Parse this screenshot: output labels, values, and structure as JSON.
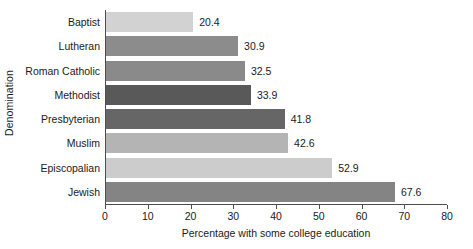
{
  "chart_data": {
    "type": "bar",
    "orientation": "horizontal",
    "title": "",
    "xlabel": "Percentage with some college education",
    "ylabel": "Denomination",
    "categories": [
      "Baptist",
      "Lutheran",
      "Roman Catholic",
      "Methodist",
      "Presbyterian",
      "Muslim",
      "Episcopalian",
      "Jewish"
    ],
    "values": [
      20.4,
      30.9,
      32.5,
      33.9,
      41.8,
      42.6,
      52.9,
      67.6
    ],
    "value_labels": [
      "20.4",
      "30.9",
      "32.5",
      "33.9",
      "41.8",
      "42.6",
      "52.9",
      "67.6"
    ],
    "bar_colors": [
      "#d2d2d2",
      "#8c8c8c",
      "#8a8a8a",
      "#595959",
      "#666666",
      "#b4b4b4",
      "#cccccc",
      "#848484"
    ],
    "xlim": [
      0,
      80
    ],
    "xticks": [
      0,
      10,
      20,
      30,
      40,
      50,
      60,
      70,
      80
    ],
    "xtick_labels": [
      "0",
      "10",
      "20",
      "30",
      "40",
      "50",
      "60",
      "70",
      "80"
    ],
    "grid": false,
    "legend": false,
    "axis_color": "#4d4d4d"
  }
}
